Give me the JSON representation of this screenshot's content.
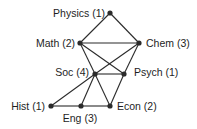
{
  "diagram": {
    "type": "network-graph",
    "nodes": [
      {
        "id": "physics",
        "label": "Physics (1)",
        "x": 110,
        "y": 13,
        "label_anchor": "end",
        "lx": 105,
        "ly": 17
      },
      {
        "id": "math",
        "label": "Math (2)",
        "x": 80,
        "y": 43,
        "label_anchor": "end",
        "lx": 75,
        "ly": 47
      },
      {
        "id": "chem",
        "label": "Chem (3)",
        "x": 139,
        "y": 43,
        "label_anchor": "start",
        "lx": 146,
        "ly": 47
      },
      {
        "id": "soc",
        "label": "Soc (4)",
        "x": 95,
        "y": 74,
        "label_anchor": "end",
        "lx": 89,
        "ly": 76
      },
      {
        "id": "psych",
        "label": "Psych (1)",
        "x": 124,
        "y": 74,
        "label_anchor": "start",
        "lx": 134,
        "ly": 76
      },
      {
        "id": "hist",
        "label": "Hist (1)",
        "x": 51,
        "y": 106,
        "label_anchor": "end",
        "lx": 45,
        "ly": 110
      },
      {
        "id": "eng",
        "label": "Eng (3)",
        "x": 81,
        "y": 106,
        "label_anchor": "middle",
        "lx": 80,
        "ly": 122
      },
      {
        "id": "econ",
        "label": "Econ (2)",
        "x": 110,
        "y": 106,
        "label_anchor": "start",
        "lx": 117,
        "ly": 110
      }
    ],
    "edges": [
      [
        "physics",
        "math"
      ],
      [
        "physics",
        "chem"
      ],
      [
        "math",
        "chem"
      ],
      [
        "math",
        "soc"
      ],
      [
        "math",
        "psych"
      ],
      [
        "chem",
        "soc"
      ],
      [
        "chem",
        "psych"
      ],
      [
        "soc",
        "psych"
      ],
      [
        "soc",
        "hist"
      ],
      [
        "soc",
        "eng"
      ],
      [
        "soc",
        "econ"
      ],
      [
        "psych",
        "econ"
      ],
      [
        "hist",
        "eng"
      ],
      [
        "eng",
        "econ"
      ]
    ],
    "colors": {
      "edge": "#2b2b2b",
      "node": "#2b2b2b",
      "label": "#1e1e1e",
      "background": "#ffffff"
    }
  }
}
